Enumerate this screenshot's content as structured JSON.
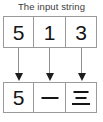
{
  "figure": {
    "caption": "The input string",
    "title_color": "#3b3b3b",
    "box_border_color": "#9a9a9a",
    "glyph_color": "#151515",
    "arrow_shaft_color": "#8e8e8e",
    "arrow_head_color": "#1d1d1d",
    "background": "#ffffff"
  },
  "input_row": {
    "label": "The input string",
    "cells": [
      {
        "value": "5",
        "kind": "digit"
      },
      {
        "value": "1",
        "kind": "digit"
      },
      {
        "value": "3",
        "kind": "digit"
      }
    ]
  },
  "arrows": [
    {
      "name": "arrow-cell-0",
      "direction": "down"
    },
    {
      "name": "arrow-cell-1",
      "direction": "down"
    },
    {
      "name": "arrow-cell-2",
      "direction": "down"
    }
  ],
  "output_row": {
    "cells": [
      {
        "value": "5",
        "kind": "digit"
      },
      {
        "value": "一",
        "kind": "cjk-numeral-one"
      },
      {
        "value": "三",
        "kind": "cjk-numeral-three"
      }
    ]
  }
}
